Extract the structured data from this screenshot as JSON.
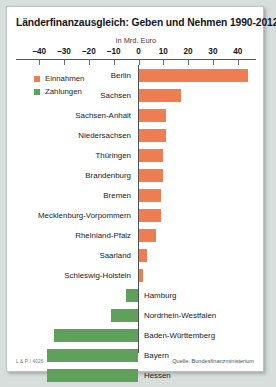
{
  "chart_data": {
    "type": "bar",
    "orientation": "horizontal",
    "title": "Länderfinanzausgleich: Geben und Nehmen 1990-2012",
    "subtitle": "in Mrd. Euro",
    "xlabel": "",
    "ylabel": "",
    "xlim": [
      -45,
      45
    ],
    "xticks": [
      -40,
      -30,
      -20,
      -10,
      0,
      10,
      20,
      30,
      40
    ],
    "xtick_labels": [
      "–40",
      "–30",
      "–20",
      "–10",
      "0",
      "10",
      "20",
      "30",
      "40"
    ],
    "grid": false,
    "legend_position": "upper-left",
    "legend": [
      {
        "label": "Einnahmen",
        "color": "#ee7d52"
      },
      {
        "label": "Zahlungen",
        "color": "#5fa05a"
      }
    ],
    "categories": [
      "Berlin",
      "Sachsen",
      "Sachsen-Anhalt",
      "Niedersachsen",
      "Thüringen",
      "Brandenburg",
      "Bremen",
      "Mecklenburg-Vorpommern",
      "Rheinland-Pfalz",
      "Saarland",
      "Schleswig-Holstein",
      "Hamburg",
      "Nordrhein-Westfalen",
      "Baden-Württemberg",
      "Bayern",
      "Hessen"
    ],
    "values": [
      44,
      17,
      11,
      11,
      10,
      10,
      9,
      9,
      7,
      3.5,
      2,
      -5,
      -11,
      -34,
      -37,
      -37
    ],
    "bars": [
      {
        "label": "Berlin",
        "value": 44,
        "type": "Einnahmen",
        "color": "#ee7d52"
      },
      {
        "label": "Sachsen",
        "value": 17,
        "type": "Einnahmen",
        "color": "#ee7d52"
      },
      {
        "label": "Sachsen-Anhalt",
        "value": 11,
        "type": "Einnahmen",
        "color": "#ee7d52"
      },
      {
        "label": "Niedersachsen",
        "value": 11,
        "type": "Einnahmen",
        "color": "#ee7d52"
      },
      {
        "label": "Thüringen",
        "value": 10,
        "type": "Einnahmen",
        "color": "#ee7d52"
      },
      {
        "label": "Brandenburg",
        "value": 10,
        "type": "Einnahmen",
        "color": "#ee7d52"
      },
      {
        "label": "Bremen",
        "value": 9,
        "type": "Einnahmen",
        "color": "#ee7d52"
      },
      {
        "label": "Mecklenburg-Vorpommern",
        "value": 9,
        "type": "Einnahmen",
        "color": "#ee7d52"
      },
      {
        "label": "Rheinland-Pfalz",
        "value": 7,
        "type": "Einnahmen",
        "color": "#ee7d52"
      },
      {
        "label": "Saarland",
        "value": 3.5,
        "type": "Einnahmen",
        "color": "#ee7d52"
      },
      {
        "label": "Schleswig-Holstein",
        "value": 2,
        "type": "Einnahmen",
        "color": "#ee7d52"
      },
      {
        "label": "Hamburg",
        "value": -5,
        "type": "Zahlungen",
        "color": "#5fa05a"
      },
      {
        "label": "Nordrhein-Westfalen",
        "value": -11,
        "type": "Zahlungen",
        "color": "#5fa05a"
      },
      {
        "label": "Baden-Württemberg",
        "value": -34,
        "type": "Zahlungen",
        "color": "#5fa05a"
      },
      {
        "label": "Bayern",
        "value": -37,
        "type": "Zahlungen",
        "color": "#5fa05a"
      },
      {
        "label": "Hessen",
        "value": -37,
        "type": "Zahlungen",
        "color": "#5fa05a"
      }
    ]
  },
  "footer": {
    "credit": "L & P / 4026",
    "source": "Quelle: Bundesfinanzministerium"
  },
  "colors": {
    "einnahmen": "#ee7d52",
    "zahlungen": "#5fa05a"
  }
}
